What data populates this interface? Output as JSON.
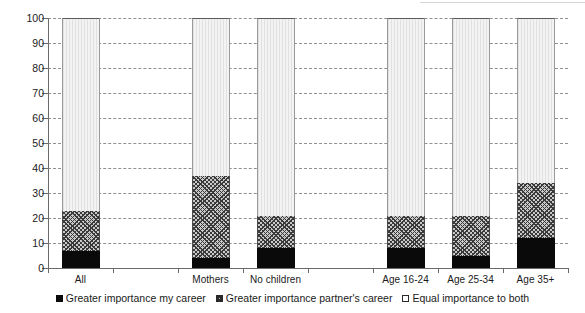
{
  "chart_data": {
    "type": "bar",
    "stacked": true,
    "title": "",
    "subtitle": "",
    "xlabel": "",
    "ylabel": "",
    "ylim": [
      0,
      100
    ],
    "yticks": [
      0,
      10,
      20,
      30,
      40,
      50,
      60,
      70,
      80,
      90,
      100
    ],
    "ytick_labels": [
      "0",
      "10",
      "20",
      "30",
      "40",
      "50",
      "60",
      "70",
      "80",
      "90",
      "100"
    ],
    "grid": true,
    "grid_style": "dashed-horizontal",
    "legend_position": "bottom-center",
    "categories": [
      "All",
      "",
      "Mothers",
      "No children",
      "",
      "Age 16-24",
      "Age 25-34",
      "Age 35+"
    ],
    "visible_categories": [
      "All",
      "Mothers",
      "No children",
      "Age 16-24",
      "Age 25-34",
      "Age 35+"
    ],
    "series": [
      {
        "name": "Greater importance my career",
        "fill": "solid-black",
        "color": "#0a0a0a",
        "values": [
          7,
          null,
          4,
          8,
          null,
          8,
          5,
          12
        ]
      },
      {
        "name": "Greater importance partner's career",
        "fill": "crosshatch",
        "color": "#c9c9c9",
        "values": [
          16,
          null,
          33,
          13,
          null,
          13,
          16,
          22
        ]
      },
      {
        "name": "Equal importance to both",
        "fill": "light-gray",
        "color": "#eceaea",
        "values": [
          77,
          null,
          63,
          79,
          null,
          79,
          79,
          66
        ]
      }
    ],
    "cumulative_tops": {
      "All": [
        7,
        23,
        100
      ],
      "Mothers": [
        4,
        37,
        100
      ],
      "No children": [
        8,
        21,
        100
      ],
      "Age 16-24": [
        8,
        21,
        100
      ],
      "Age 25-34": [
        5,
        21,
        100
      ],
      "Age 35+": [
        12,
        34,
        100
      ]
    }
  },
  "legend": {
    "items": [
      {
        "label": "Greater importance my career"
      },
      {
        "label": "Greater importance partner's career"
      },
      {
        "label": "Equal importance to both"
      }
    ]
  }
}
